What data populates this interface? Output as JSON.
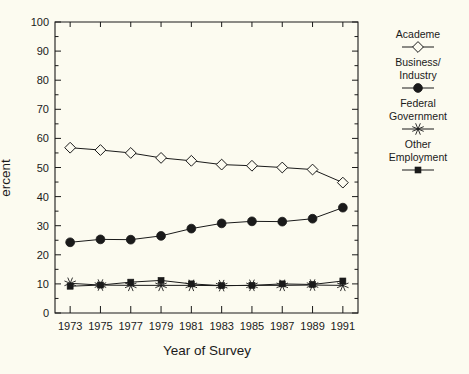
{
  "chart_data": {
    "type": "line",
    "title": "",
    "xlabel": "Year of Survey",
    "ylabel": "Percent",
    "ylabel_visible": "ercent",
    "categories": [
      1973,
      1975,
      1977,
      1979,
      1981,
      1983,
      1985,
      1987,
      1989,
      1991
    ],
    "xtick_labels": [
      "1973",
      "1975",
      "1977",
      "1979",
      "1981",
      "1983",
      "1985",
      "1987",
      "1989",
      "1991"
    ],
    "ytick_labels": [
      "0",
      "10",
      "20",
      "30",
      "40",
      "50",
      "60",
      "70",
      "80",
      "90",
      "100"
    ],
    "ytick_values": [
      0,
      10,
      20,
      30,
      40,
      50,
      60,
      70,
      80,
      90,
      100
    ],
    "ylim": [
      0,
      100
    ],
    "xlim": [
      1972,
      1992
    ],
    "grid": false,
    "legend_position": "right",
    "series": [
      {
        "name": "Academe",
        "marker": "open-diamond",
        "values": [
          56.8,
          56.0,
          55.0,
          53.3,
          52.3,
          51.0,
          50.6,
          50.0,
          49.3,
          44.8
        ]
      },
      {
        "name": "Business/ Industry",
        "marker": "filled-circle",
        "values": [
          24.3,
          25.3,
          25.2,
          26.5,
          29.0,
          30.8,
          31.5,
          31.4,
          32.4,
          36.2
        ]
      },
      {
        "name": "Federal Government",
        "marker": "asterisk",
        "values": [
          10.2,
          9.6,
          9.5,
          9.5,
          9.5,
          9.4,
          9.5,
          9.5,
          9.6,
          9.5
        ]
      },
      {
        "name": "Other Employment",
        "marker": "small-filled-square",
        "values": [
          9.2,
          9.6,
          10.6,
          11.2,
          10.0,
          9.4,
          9.5,
          10.0,
          9.8,
          11.0
        ]
      }
    ]
  },
  "legend": {
    "entries": [
      {
        "label_lines": [
          "Academe"
        ],
        "marker": "open-diamond"
      },
      {
        "label_lines": [
          "Business/",
          "Industry"
        ],
        "marker": "filled-circle"
      },
      {
        "label_lines": [
          "Federal",
          "Government"
        ],
        "marker": "asterisk"
      },
      {
        "label_lines": [
          "Other",
          "Employment"
        ],
        "marker": "small-filled-square"
      }
    ]
  },
  "colors": {
    "background": "#fcfbf0",
    "ink": "#1a1a1a"
  }
}
